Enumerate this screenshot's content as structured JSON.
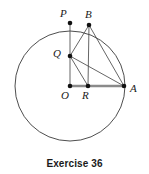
{
  "figure": {
    "caption": "Exercise 36",
    "stroke_color": "#3a3a3a",
    "chord_color": "#4a4a4a",
    "radius_color": "#8a8a8a",
    "point_color": "#111111",
    "background": "#ffffff",
    "circle": {
      "center_x": 70,
      "center_y": 86,
      "radius": 55
    },
    "points": [
      {
        "id": "P",
        "label": "P",
        "x": 70,
        "y": 23,
        "label_x": 60,
        "label_y": 8
      },
      {
        "id": "B",
        "label": "B",
        "x": 89,
        "y": 25,
        "label_x": 85,
        "label_y": 9
      },
      {
        "id": "Q",
        "label": "Q",
        "x": 70,
        "y": 56,
        "label_x": 53,
        "label_y": 48
      },
      {
        "id": "O",
        "label": "O",
        "x": 70,
        "y": 86,
        "label_x": 61,
        "label_y": 90
      },
      {
        "id": "R",
        "label": "R",
        "x": 88,
        "y": 86,
        "label_x": 82,
        "label_y": 90
      },
      {
        "id": "A",
        "label": "A",
        "x": 124,
        "y": 86,
        "label_x": 130,
        "label_y": 83
      }
    ],
    "segments": [
      {
        "id": "P-O",
        "from": "P",
        "to": "O",
        "kind": "thin"
      },
      {
        "id": "B-R",
        "from": "B",
        "to": "R",
        "kind": "thin"
      },
      {
        "id": "Q-B",
        "from": "Q",
        "to": "B",
        "kind": "thin"
      },
      {
        "id": "Q-R",
        "from": "Q",
        "to": "R",
        "kind": "thin"
      },
      {
        "id": "Q-A",
        "from": "Q",
        "to": "A",
        "kind": "thin"
      },
      {
        "id": "B-A",
        "from": "B",
        "to": "A",
        "kind": "thin"
      },
      {
        "id": "O-A",
        "from": "O",
        "to": "A",
        "kind": "thick"
      }
    ]
  }
}
